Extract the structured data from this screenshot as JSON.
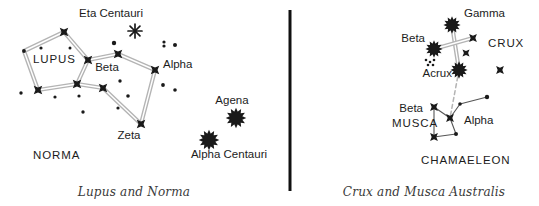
{
  "figure": {
    "type": "star-chart",
    "panel_count": 2,
    "divider": {
      "color": "#111111",
      "x": 290,
      "y1": 10,
      "y2": 191,
      "width": 3
    }
  },
  "style": {
    "line_color": "#b4b4b4",
    "star_color": "#1a1a1a",
    "background": "#ffffff",
    "text_color": "#1c1c1c",
    "caption_color": "#3a3a3a"
  },
  "panels": [
    {
      "id": "left",
      "caption": "Lupus and Norma",
      "caption_pos": {
        "x": 134,
        "y": 196
      },
      "constellation_labels": [
        {
          "name": "LUPUS",
          "x": 33,
          "y": 63
        },
        {
          "name": "NORMA",
          "x": 33,
          "y": 159
        }
      ],
      "star_labels": [
        {
          "name": "Eta Centauri",
          "x": 111,
          "y": 17,
          "anchor": "middle"
        },
        {
          "name": "Beta",
          "x": 107,
          "y": 71,
          "anchor": "middle"
        },
        {
          "name": "Alpha",
          "x": 163,
          "y": 68,
          "anchor": "start"
        },
        {
          "name": "Zeta",
          "x": 129,
          "y": 139,
          "anchor": "middle"
        },
        {
          "name": "Agena",
          "x": 232,
          "y": 104,
          "anchor": "middle"
        },
        {
          "name": "Alpha  Centauri",
          "x": 229,
          "y": 158,
          "anchor": "middle"
        }
      ],
      "bright_stars": [
        {
          "name": "Agena",
          "x": 236,
          "y": 118,
          "r": 9.5
        },
        {
          "name": "Alpha Centauri",
          "x": 209,
          "y": 140,
          "r": 9.5
        }
      ],
      "asterisk_stars": [
        {
          "name": "Eta Centauri",
          "x": 135,
          "y": 31,
          "r": 7
        }
      ],
      "cross_stars": [
        {
          "name": "lupus-n",
          "x": 64,
          "y": 32,
          "r": 6
        },
        {
          "name": "lupus-e",
          "x": 88,
          "y": 60,
          "r": 6
        },
        {
          "name": "lupus-s",
          "x": 77,
          "y": 84,
          "r": 6
        },
        {
          "name": "lupus-w",
          "x": 38,
          "y": 90,
          "r": 6
        },
        {
          "name": "beta-lupi",
          "x": 118,
          "y": 54,
          "r": 6
        },
        {
          "name": "alpha-lupi",
          "x": 155,
          "y": 70,
          "r": 6
        },
        {
          "name": "zeta-lupi",
          "x": 141,
          "y": 124,
          "r": 6
        },
        {
          "name": "mid-lupi",
          "x": 103,
          "y": 88,
          "r": 6
        }
      ],
      "faint_stars": [
        {
          "x": 24,
          "y": 51,
          "r": 1.9
        },
        {
          "x": 41,
          "y": 48,
          "r": 1.6
        },
        {
          "x": 70,
          "y": 48,
          "r": 1.5
        },
        {
          "x": 21,
          "y": 93,
          "r": 1.7
        },
        {
          "x": 55,
          "y": 97,
          "r": 1.6
        },
        {
          "x": 79,
          "y": 96,
          "r": 1.6
        },
        {
          "x": 83,
          "y": 112,
          "r": 1.7
        },
        {
          "x": 114,
          "y": 43,
          "r": 2.2
        },
        {
          "x": 120,
          "y": 81,
          "r": 1.7
        },
        {
          "x": 128,
          "y": 96,
          "r": 1.8
        },
        {
          "x": 118,
          "y": 108,
          "r": 1.6
        },
        {
          "x": 164,
          "y": 42,
          "r": 1.6
        },
        {
          "x": 164,
          "y": 46,
          "r": 1.6
        },
        {
          "x": 175,
          "y": 45,
          "r": 2.0
        },
        {
          "x": 163,
          "y": 85,
          "r": 1.9
        },
        {
          "x": 175,
          "y": 90,
          "r": 1.8
        }
      ],
      "figure_lines": [
        {
          "from": [
            64,
            32
          ],
          "to": [
            38,
            90
          ],
          "style": "double",
          "via": [
            [
              24,
              51
            ]
          ]
        },
        {
          "from": [
            64,
            32
          ],
          "to": [
            88,
            60
          ],
          "style": "double"
        },
        {
          "from": [
            88,
            60
          ],
          "to": [
            77,
            84
          ],
          "style": "double"
        },
        {
          "from": [
            77,
            84
          ],
          "to": [
            38,
            90
          ],
          "style": "double"
        },
        {
          "from": [
            88,
            60
          ],
          "to": [
            118,
            54
          ],
          "style": "double"
        },
        {
          "from": [
            118,
            54
          ],
          "to": [
            155,
            70
          ],
          "style": "double"
        },
        {
          "from": [
            155,
            70
          ],
          "to": [
            141,
            124
          ],
          "style": "double"
        },
        {
          "from": [
            141,
            124
          ],
          "to": [
            103,
            88
          ],
          "style": "double"
        },
        {
          "from": [
            103,
            88
          ],
          "to": [
            77,
            84
          ],
          "style": "double"
        }
      ]
    },
    {
      "id": "right",
      "caption": "Crux and Musca Australis",
      "caption_pos": {
        "x": 424,
        "y": 196
      },
      "constellation_labels": [
        {
          "name": "CRUX",
          "x": 488,
          "y": 47
        },
        {
          "name": "MUSCA",
          "x": 392,
          "y": 127
        },
        {
          "name": "CHAMAELEON",
          "x": 421,
          "y": 164
        }
      ],
      "star_labels": [
        {
          "name": "Gamma",
          "x": 464,
          "y": 17,
          "anchor": "start"
        },
        {
          "name": "Beta",
          "x": 425,
          "y": 42,
          "anchor": "end"
        },
        {
          "name": "Acrux",
          "x": 452,
          "y": 77,
          "anchor": "end"
        },
        {
          "name": "Beta",
          "x": 423,
          "y": 112,
          "anchor": "end"
        },
        {
          "name": "Alpha",
          "x": 464,
          "y": 124,
          "anchor": "start"
        }
      ],
      "bright_stars": [
        {
          "name": "Gamma Crucis",
          "x": 452,
          "y": 25,
          "r": 8
        },
        {
          "name": "Beta Crucis",
          "x": 434,
          "y": 49,
          "r": 8
        },
        {
          "name": "Acrux",
          "x": 459,
          "y": 70,
          "r": 8
        }
      ],
      "cross_stars": [
        {
          "name": "delta-crucis",
          "x": 473,
          "y": 38,
          "r": 5.5
        },
        {
          "name": "epsilon-crucis",
          "x": 466,
          "y": 53,
          "r": 5
        },
        {
          "name": "crux-outlier",
          "x": 500,
          "y": 70,
          "r": 5.5
        },
        {
          "name": "beta-muscae",
          "x": 434,
          "y": 107,
          "r": 5.5
        },
        {
          "name": "alpha-muscae",
          "x": 450,
          "y": 118,
          "r": 5.5
        },
        {
          "name": "musca-low",
          "x": 434,
          "y": 137,
          "r": 5.5
        }
      ],
      "faint_stars": [
        {
          "x": 460,
          "y": 104,
          "r": 1.8
        },
        {
          "x": 487,
          "y": 97,
          "r": 2.2
        },
        {
          "x": 456,
          "y": 134,
          "r": 2.0
        },
        {
          "x": 426,
          "y": 60,
          "r": 1.3
        },
        {
          "x": 430,
          "y": 62,
          "r": 1.3
        },
        {
          "x": 434,
          "y": 60,
          "r": 1.3
        },
        {
          "x": 428,
          "y": 65,
          "r": 1.3
        },
        {
          "x": 433,
          "y": 65,
          "r": 1.3
        }
      ],
      "figure_lines": [
        {
          "from": [
            452,
            25
          ],
          "to": [
            459,
            70
          ],
          "style": "double"
        },
        {
          "from": [
            434,
            49
          ],
          "to": [
            473,
            38
          ],
          "style": "double"
        },
        {
          "from": [
            459,
            70
          ],
          "to": [
            450,
            118
          ],
          "style": "dashed"
        },
        {
          "from": [
            434,
            107
          ],
          "to": [
            450,
            118
          ],
          "style": "single"
        },
        {
          "from": [
            450,
            118
          ],
          "to": [
            460,
            104
          ],
          "style": "single"
        },
        {
          "from": [
            460,
            104
          ],
          "to": [
            487,
            97
          ],
          "style": "single"
        },
        {
          "from": [
            434,
            107
          ],
          "to": [
            434,
            137
          ],
          "style": "single"
        },
        {
          "from": [
            450,
            118
          ],
          "to": [
            456,
            134
          ],
          "style": "single"
        },
        {
          "from": [
            434,
            137
          ],
          "to": [
            456,
            134
          ],
          "style": "single"
        }
      ]
    }
  ]
}
